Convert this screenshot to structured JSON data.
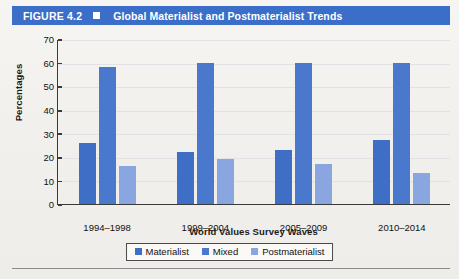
{
  "header": {
    "figure_number": "FIGURE 4.2",
    "marker_icon": "square-icon",
    "title": "Global Materialist and Postmaterialist Trends",
    "band_color": "#3a6ec9"
  },
  "chart_data": {
    "type": "bar",
    "title": "Global Materialist and Postmaterialist Trends",
    "xlabel": "World Values Survey Waves",
    "ylabel": "Percentages",
    "categories": [
      "1994–1998",
      "1999–2004",
      "2005–2009",
      "2010–2014"
    ],
    "series": [
      {
        "name": "Materialist",
        "color": "#3f6ec6",
        "values": [
          26,
          22,
          23,
          27
        ]
      },
      {
        "name": "Mixed",
        "color": "#4a78cd",
        "values": [
          58,
          60,
          60,
          60
        ]
      },
      {
        "name": "Postmaterialist",
        "color": "#8aa6e0",
        "values": [
          16,
          19,
          17,
          13
        ]
      }
    ],
    "ylim": [
      0,
      70
    ],
    "yticks": [
      70,
      60,
      50,
      40,
      30,
      20,
      10,
      0
    ],
    "grid": true,
    "legend_position": "bottom"
  }
}
